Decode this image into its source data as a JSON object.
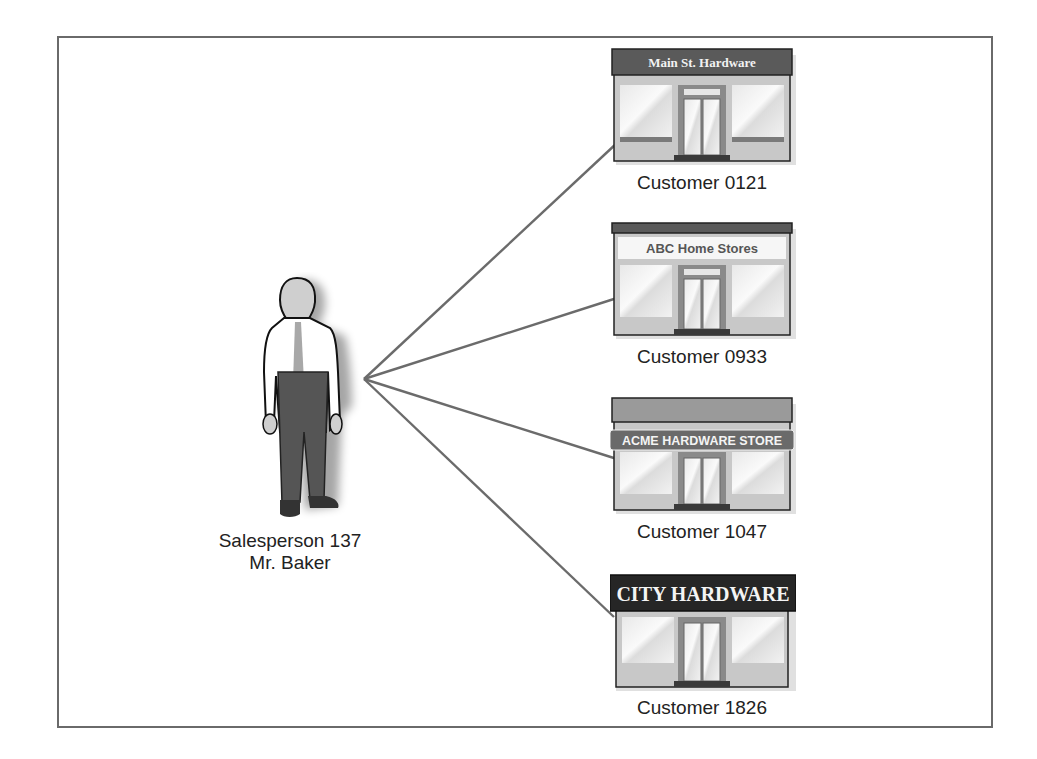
{
  "diagram": {
    "type": "one-to-many relationship",
    "salesperson": {
      "label_line1": "Salesperson 137",
      "label_line2": "Mr. Baker",
      "icon": "person-icon"
    },
    "customers": [
      {
        "id": "0121",
        "label": "Customer 0121",
        "store_sign": "Main St. Hardware",
        "icon": "storefront-icon"
      },
      {
        "id": "0933",
        "label": "Customer 0933",
        "store_sign": "ABC Home Stores",
        "icon": "storefront-icon"
      },
      {
        "id": "1047",
        "label": "Customer 1047",
        "store_sign": "ACME HARDWARE STORE",
        "icon": "storefront-icon"
      },
      {
        "id": "1826",
        "label": "Customer 1826",
        "store_sign": "CITY HARDWARE",
        "icon": "storefront-icon"
      }
    ],
    "colors": {
      "frame": "#6a6a6a",
      "connector": "#6b6b6b",
      "sign_dark": "#5a5a5a",
      "sign_black": "#262626",
      "storefront": "#c8c8c8",
      "pants": "#555555",
      "tie": "#a8a8a8"
    }
  }
}
